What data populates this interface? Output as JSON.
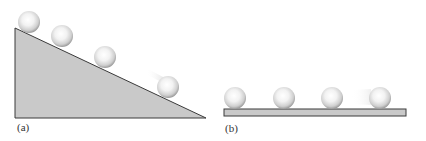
{
  "panels": [
    {
      "id": "a",
      "label": "(a)",
      "description": "Balls rolling down an inclined plane"
    },
    {
      "id": "b",
      "label": "(b)",
      "description": "Balls rolling on a horizontal surface"
    }
  ],
  "colors": {
    "surface_fill": "#c9c9c9",
    "surface_stroke": "#3a3a3a",
    "ball_highlight": "#ffffff",
    "ball_shadow": "#9a9a9a"
  },
  "panel_a": {
    "ball_count": 4,
    "label_text": "(a)"
  },
  "panel_b": {
    "ball_count": 4,
    "label_text": "(b)"
  }
}
